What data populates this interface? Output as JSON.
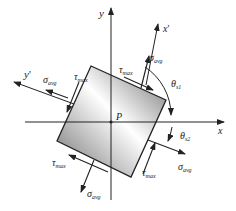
{
  "diagram": {
    "type": "stress-element",
    "colors": {
      "line": "#222222",
      "shade_dark": "#7a7a7a",
      "shade_light": "#ffffff"
    },
    "axes": {
      "x": {
        "label": "x"
      },
      "y": {
        "label": "y"
      },
      "x_prime": {
        "label": "x",
        "prime": "'"
      },
      "y_prime": {
        "label": "y",
        "prime": "'"
      }
    },
    "origin": {
      "label": "P"
    },
    "stresses": {
      "sigma": {
        "symbol": "σ",
        "sub": "avg"
      },
      "tau": {
        "symbol": "τ",
        "sub": "max"
      }
    },
    "angles": {
      "theta_s1": {
        "symbol": "θ",
        "sub": "s1"
      },
      "theta_s2": {
        "symbol": "θ",
        "sub": "s2"
      }
    }
  }
}
